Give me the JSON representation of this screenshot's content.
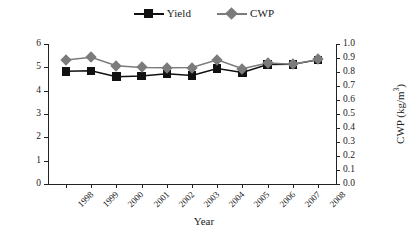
{
  "legend": {
    "position": "top-center",
    "entries": [
      {
        "label": "Yield",
        "marker": "filled-square-marker",
        "color": "#111111"
      },
      {
        "label": "CWP",
        "marker": "filled-diamond-marker",
        "color": "#7b7b7b"
      }
    ]
  },
  "axes": {
    "x_title": "Year",
    "y_left_title": "Yield (t/ha)",
    "y_right_title_main": "CWP (kg/m",
    "y_right_title_sup": "3",
    "y_right_title_end": ")",
    "y_left_ticks": [
      "0",
      "1",
      "2",
      "3",
      "4",
      "5",
      "6"
    ],
    "y_right_ticks": [
      "0.0",
      "0.1",
      "0.2",
      "0.3",
      "0.4",
      "0.5",
      "0.6",
      "0.7",
      "0.8",
      "0.9",
      "1.0"
    ]
  },
  "chart_data": {
    "type": "line",
    "title": "",
    "xlabel": "Year",
    "ylabel": "Yield (t/ha)",
    "y2label": "CWP (kg/m3)",
    "grid": false,
    "legend_position": "top-center",
    "categories": [
      "1998",
      "1999",
      "2000",
      "2001",
      "2002",
      "2003",
      "2004",
      "2005",
      "2006",
      "2007",
      "2008"
    ],
    "ylim": [
      0,
      6
    ],
    "y2lim": [
      0.0,
      1.0
    ],
    "series": [
      {
        "name": "Yield",
        "axis": "left",
        "units": "t/ha",
        "color": "#111111",
        "marker": "square",
        "values": [
          4.83,
          4.85,
          4.6,
          4.63,
          4.72,
          4.65,
          4.95,
          4.78,
          5.12,
          5.13,
          5.32
        ]
      },
      {
        "name": "CWP",
        "axis": "right",
        "units": "kg/m3",
        "color": "#7b7b7b",
        "marker": "diamond",
        "values": [
          0.885,
          0.905,
          0.845,
          0.833,
          0.83,
          0.832,
          0.888,
          0.823,
          0.865,
          0.855,
          0.89
        ]
      }
    ]
  }
}
